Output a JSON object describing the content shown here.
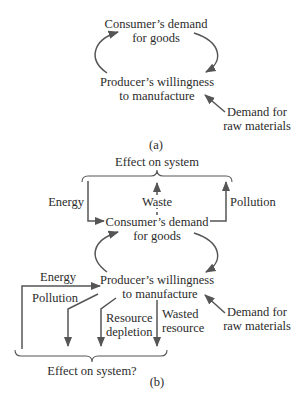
{
  "panel_a": {
    "consumer_line1": "Consumer’s demand",
    "consumer_line2": "for goods",
    "producer_line1": "Producer’s willingness",
    "producer_line2": "to manufacture",
    "raw_line1": "Demand for",
    "raw_line2": "raw materials",
    "caption": "(a)"
  },
  "panel_b": {
    "top_effect": "Effect on system",
    "energy_top": "Energy",
    "waste": "Waste",
    "pollution_top": "Pollution",
    "consumer_line1": "Consumer’s demand",
    "consumer_line2": "for goods",
    "energy_bottom": "Energy",
    "pollution_bottom": "Pollution",
    "producer_line1": "Producer’s willingness",
    "producer_line2": "to manufacture",
    "raw_line1": "Demand for",
    "raw_line2": "raw materials",
    "resource_line1": "Resource",
    "resource_line2": "depletion",
    "wasted_line1": "Wasted",
    "wasted_line2": "resource",
    "bottom_effect": "Effect on system?",
    "caption": "(b)"
  },
  "colors": {
    "line": "#555555",
    "text": "#2b2b2b",
    "background": "#ffffff"
  }
}
